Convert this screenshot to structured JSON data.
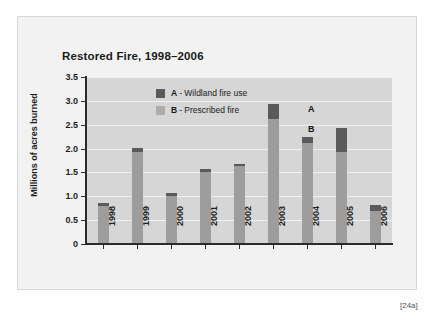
{
  "figure": {
    "caption": "[24a]",
    "title": "Restored Fire, 1998–2006"
  },
  "legend": [
    {
      "key": "A",
      "separator": "-",
      "label": "Wildland fire use",
      "color": "#5a5a5c"
    },
    {
      "key": "B",
      "separator": "-",
      "label": "Prescribed fire",
      "color": "#acacac"
    }
  ],
  "annotations": [
    {
      "name": "annotation-a",
      "text": "A"
    },
    {
      "name": "annotation-b",
      "text": "B"
    }
  ],
  "axes": {
    "y_title": "Millions of acres burned",
    "y_ticks": [
      "3.5",
      "3.0",
      "2.5",
      "2.0",
      "1.5",
      "1.0",
      "0.5",
      "0"
    ],
    "x_ticks": [
      "1998",
      "1999",
      "2000",
      "2001",
      "2002",
      "2003",
      "2004",
      "2005",
      "2006"
    ]
  },
  "chart_data": {
    "type": "bar",
    "title": "Restored Fire, 1998–2006",
    "xlabel": "",
    "ylabel": "Millions of acres burned",
    "ylim": [
      0,
      3.5
    ],
    "ytick_step": 0.5,
    "grid": true,
    "stacked": true,
    "legend_position": "inside-top-center",
    "categories": [
      "1998",
      "1999",
      "2000",
      "2001",
      "2002",
      "2003",
      "2004",
      "2005",
      "2006"
    ],
    "series": [
      {
        "name": "B - Prescribed fire",
        "key": "B",
        "color": "#9d9d9d",
        "values": [
          0.79,
          1.93,
          1.01,
          1.51,
          1.63,
          2.62,
          2.12,
          1.93,
          0.7
        ]
      },
      {
        "name": "A - Wildland fire use",
        "key": "A",
        "color": "#5a5a5c",
        "values": [
          0.06,
          0.09,
          0.05,
          0.07,
          0.05,
          0.32,
          0.12,
          0.5,
          0.12
        ]
      }
    ],
    "totals": [
      0.85,
      2.02,
      1.06,
      1.58,
      1.68,
      2.94,
      2.24,
      2.43,
      0.82
    ]
  },
  "colors": {
    "plot_background": "#d6d6d6",
    "figure_background": "#f2f2f2",
    "page_background": "#fefefe",
    "gridline": "#efefef",
    "axis": "#2b2b2b",
    "series_a": "#5a5a5c",
    "series_b": "#9d9d9d"
  }
}
